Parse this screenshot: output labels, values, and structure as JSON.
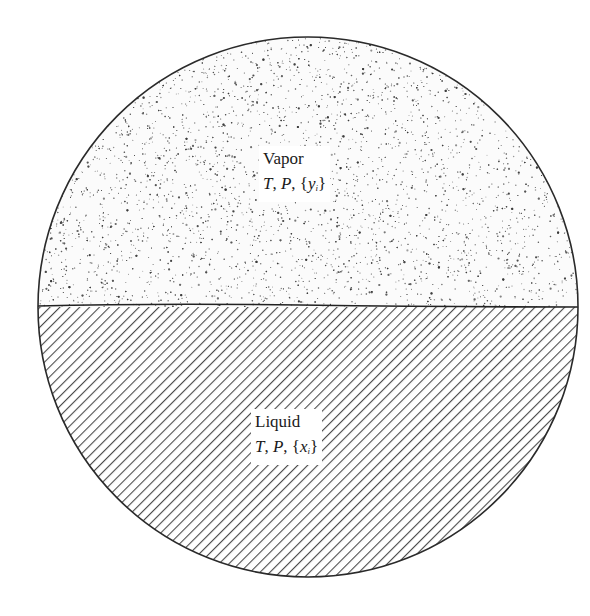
{
  "figure": {
    "type": "two-phase vapor-liquid equilibrium schematic",
    "shape": "circle",
    "colors": {
      "outline": "#2a2a2a",
      "stipple": "#3a3a3a",
      "hatch": "#4a4a4a",
      "background": "#ffffff"
    }
  },
  "phases": {
    "vapor": {
      "title": "Vapor",
      "var_T": "T",
      "var_P": "P",
      "comp_open": "{",
      "comp_var": "y",
      "comp_sub": "i",
      "comp_close": "}",
      "sep": ", ",
      "fill": "stipple"
    },
    "liquid": {
      "title": "Liquid",
      "var_T": "T",
      "var_P": "P",
      "comp_open": "{",
      "comp_var": "x",
      "comp_sub": "i",
      "comp_close": "}",
      "sep": ", ",
      "fill": "diagonal-hatch"
    }
  }
}
